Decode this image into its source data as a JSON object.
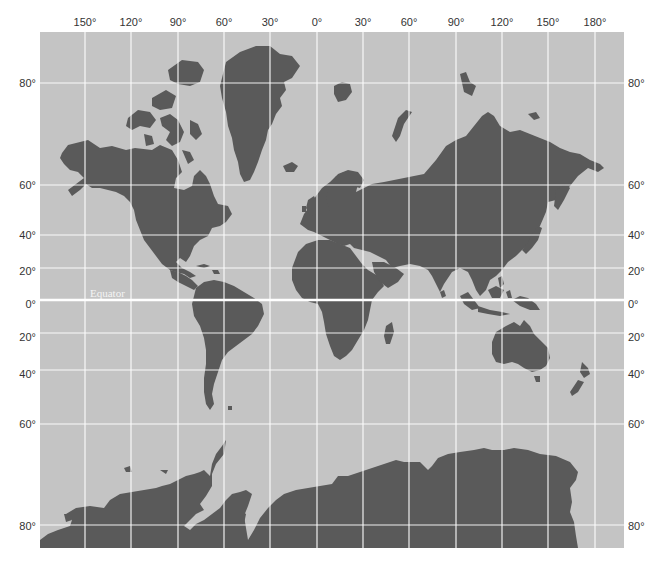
{
  "map": {
    "projection": "Mercator",
    "colors": {
      "ocean": "#c4c4c4",
      "land": "#5a5a5a",
      "grid": "#ffffff",
      "label": "#333333"
    },
    "equator_label": "Equator",
    "longitude_labels": [
      "150°",
      "120°",
      "90°",
      "60°",
      "30°",
      "0°",
      "30°",
      "60°",
      "90°",
      "120°",
      "150°",
      "180°"
    ],
    "latitude_labels_left": [
      "80°",
      "60°",
      "40°",
      "20°",
      "0°",
      "20°",
      "40°",
      "60°",
      "80°"
    ],
    "latitude_labels_right": [
      "80°",
      "60°",
      "40°",
      "20°",
      "0°",
      "20°",
      "40°",
      "60°",
      "80°"
    ],
    "longitudes": [
      -150,
      -120,
      -90,
      -60,
      -30,
      0,
      30,
      60,
      90,
      120,
      150,
      180
    ],
    "latitudes": [
      80,
      60,
      40,
      20,
      0,
      -20,
      -40,
      -60,
      -80
    ],
    "landmasses": [
      "North America",
      "Greenland",
      "South America",
      "Europe",
      "Asia",
      "Africa",
      "Australia",
      "New Zealand",
      "Antarctica"
    ]
  }
}
